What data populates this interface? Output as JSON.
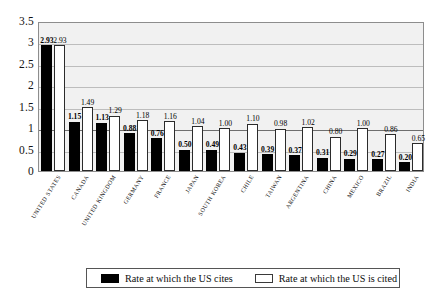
{
  "chart_data": {
    "type": "bar",
    "title": "",
    "subtitle": "",
    "xlabel": "",
    "ylabel": "",
    "ylim": [
      0,
      3.5
    ],
    "ytick_labels": [
      "3.5",
      "3",
      "2.5",
      "2",
      "1.5",
      "1",
      "0.5",
      "0"
    ],
    "yticks": [
      3.5,
      3,
      2.5,
      2,
      1.5,
      1,
      0.5,
      0
    ],
    "grid": true,
    "grid_emphasis_value": 1,
    "legend_position": "bottom",
    "categories": [
      "United States",
      "Canada",
      "United Kingdom",
      "Germany",
      "France",
      "Japan",
      "South Korea",
      "Chile",
      "Taiwan",
      "Argentina",
      "China",
      "Mexico",
      "Brazil",
      "India"
    ],
    "series": [
      {
        "name": "Rate at which the US cites",
        "color": "#000000",
        "values": [
          2.93,
          1.15,
          1.13,
          0.88,
          0.76,
          0.5,
          0.49,
          0.43,
          0.39,
          0.37,
          0.31,
          0.29,
          0.27,
          0.2
        ],
        "labels": [
          "2.93",
          "1.15",
          "1.13",
          "0.88",
          "0.76",
          "0.50",
          "0.49",
          "0.43",
          "0.39",
          "0.37",
          "0.31",
          "0.29",
          "0.27",
          "0.20"
        ]
      },
      {
        "name": "Rate at which the US is cited",
        "color": "#ffffff",
        "values": [
          2.93,
          1.49,
          1.29,
          1.18,
          1.16,
          1.04,
          1.0,
          1.1,
          0.98,
          1.02,
          0.8,
          1.0,
          0.86,
          0.65
        ],
        "labels": [
          "2.93",
          "1.49",
          "1.29",
          "1.18",
          "1.16",
          "1.04",
          "1.00",
          "1.10",
          "0.98",
          "1.02",
          "0.80",
          "1.00",
          "0.86",
          "0.65"
        ]
      }
    ]
  },
  "legend": {
    "items": [
      {
        "label": "Rate at which the US cites",
        "swatch": "black"
      },
      {
        "label": "Rate at which the US is cited",
        "swatch": "white"
      }
    ]
  },
  "colors": {
    "plot_background": "#f1f1f1",
    "plot_border": "#8d8d8d",
    "gridline": "#bdbdbd",
    "gridline_major": "#6e6e6e",
    "series_cites": "#000000",
    "series_cited": "#ffffff",
    "page_background": "#ffffff"
  }
}
